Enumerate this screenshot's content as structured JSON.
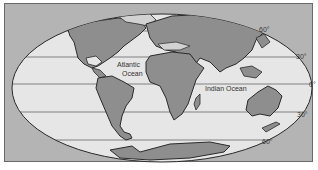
{
  "map": {
    "projection": "Mollweide-style world outline",
    "colors": {
      "background_frame": "#b4b4b4",
      "ocean": "#e6e6e6",
      "land": "#8e8e8e",
      "shelf": "#d2d2d2",
      "outline": "#2a2a2a"
    },
    "labels": {
      "atlantic_line1": "Atlantic",
      "atlantic_line2": "Ocean",
      "indian": "Indian Ocean"
    },
    "latitudes": [
      {
        "label": "60°",
        "side": "north"
      },
      {
        "label": "30°",
        "side": "north"
      },
      {
        "label": "0°",
        "side": "equator"
      },
      {
        "label": "30°",
        "side": "south"
      },
      {
        "label": "60°",
        "side": "south"
      }
    ]
  }
}
